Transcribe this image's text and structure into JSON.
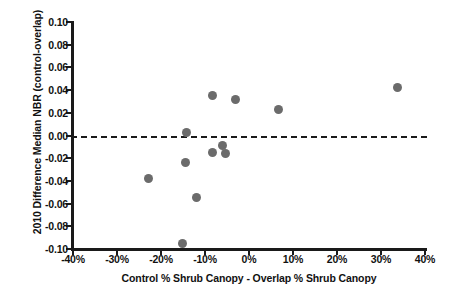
{
  "chart_data": {
    "type": "scatter",
    "title": "",
    "xlabel": "Control % Shrub Canopy - Overlap % Shrub Canopy",
    "ylabel": "2010 Difference Median NBR (control-overlap)",
    "xlim": [
      -40,
      40
    ],
    "ylim": [
      -0.1,
      0.1
    ],
    "xticks": [
      -40,
      -30,
      -20,
      -10,
      0,
      10,
      20,
      30,
      40
    ],
    "xticklabels": [
      "-40%",
      "-30%",
      "-20%",
      "-10%",
      "0%",
      "10%",
      "20%",
      "30%",
      "40%"
    ],
    "yticks": [
      0.1,
      0.08,
      0.06,
      0.04,
      0.02,
      0.0,
      -0.02,
      -0.04,
      -0.06,
      -0.08,
      -0.1
    ],
    "yticklabels": [
      "0.10",
      "0.08",
      "0.06",
      "0.04",
      "0.02",
      "0.00",
      "-0.02",
      "-0.04",
      "-0.06",
      "-0.08",
      "-0.10"
    ],
    "grid": false,
    "legend": null,
    "marker_color": "#6b6b6b",
    "axis_color": "#1a1a1a",
    "reference_line": {
      "y": 0.0,
      "style": "dashed",
      "color": "#1a1a1a"
    },
    "points": [
      {
        "x": -22.8,
        "y": -0.038
      },
      {
        "x": -15.2,
        "y": -0.095
      },
      {
        "x": -14.2,
        "y": 0.003
      },
      {
        "x": -14.4,
        "y": -0.024
      },
      {
        "x": -11.9,
        "y": -0.055
      },
      {
        "x": -8.4,
        "y": -0.015
      },
      {
        "x": -8.2,
        "y": 0.035
      },
      {
        "x": -6.0,
        "y": -0.009
      },
      {
        "x": -5.3,
        "y": -0.016
      },
      {
        "x": -3.1,
        "y": 0.032
      },
      {
        "x": 6.8,
        "y": 0.023
      },
      {
        "x": 33.8,
        "y": 0.042
      }
    ]
  }
}
